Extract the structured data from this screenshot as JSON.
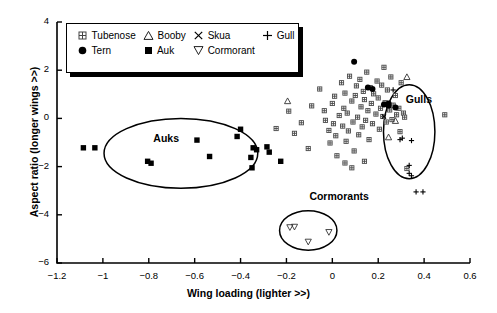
{
  "chart_data": {
    "type": "scatter",
    "title": "",
    "xlabel": "Wing loading (lighter >>)",
    "ylabel": "Aspect ratio (longer wings >>)",
    "xlim": [
      -1.2,
      0.6
    ],
    "ylim": [
      -6,
      4
    ],
    "xticks": [
      "−1.2",
      "−1",
      "−0.8",
      "−0.6",
      "−0.4",
      "−0.2",
      "0",
      "0.2",
      "0.4",
      "0.6"
    ],
    "xtick_values": [
      -1.2,
      -1.0,
      -0.8,
      -0.6,
      -0.4,
      -0.2,
      0,
      0.2,
      0.4,
      0.6
    ],
    "yticks": [
      "4",
      "2",
      "0",
      "−2",
      "−4",
      "−6"
    ],
    "ytick_values": [
      4,
      2,
      0,
      -2,
      -4,
      -6
    ],
    "grid": false,
    "legend_position": "top-left",
    "legend": [
      {
        "label": "Tubenose",
        "marker": "crossed-square"
      },
      {
        "label": "Booby",
        "marker": "open-triangle-up"
      },
      {
        "label": "Skua",
        "marker": "times"
      },
      {
        "label": "Gull",
        "marker": "plus"
      },
      {
        "label": "Tern",
        "marker": "filled-circle"
      },
      {
        "label": "Auk",
        "marker": "filled-square"
      },
      {
        "label": "Cormorant",
        "marker": "open-triangle-down"
      }
    ],
    "annotations": [
      {
        "text": "Auks",
        "x": -0.78,
        "y": -0.85
      },
      {
        "text": "Gulls",
        "x": 0.32,
        "y": 0.75
      },
      {
        "text": "Cormorants",
        "x": -0.1,
        "y": -3.25
      }
    ],
    "ellipses": [
      {
        "label": "Auks",
        "cx": -0.66,
        "cy": -1.45,
        "rx": 0.335,
        "ry": 1.45,
        "rot": 0
      },
      {
        "label": "Gulls",
        "cx": 0.335,
        "cy": -0.55,
        "rx": 0.112,
        "ry": 1.95,
        "rot": 0
      },
      {
        "label": "Cormorants",
        "cx": -0.105,
        "cy": -4.65,
        "rx": 0.125,
        "ry": 0.82,
        "rot": 0
      }
    ],
    "series": [
      {
        "name": "Auk",
        "marker": "filled-square",
        "points": [
          [
            -1.085,
            -1.22
          ],
          [
            -1.035,
            -1.22
          ],
          [
            -0.805,
            -1.78
          ],
          [
            -0.79,
            -1.86
          ],
          [
            -0.59,
            -0.9
          ],
          [
            -0.535,
            -1.58
          ],
          [
            -0.4,
            -0.45
          ],
          [
            -0.415,
            -0.75
          ],
          [
            -0.345,
            -1.22
          ],
          [
            -0.33,
            -1.3
          ],
          [
            -0.355,
            -1.62
          ],
          [
            -0.35,
            -2.05
          ],
          [
            -0.285,
            -1.18
          ],
          [
            -0.275,
            -1.4
          ],
          [
            -0.225,
            -1.78
          ]
        ]
      },
      {
        "name": "Tubenose",
        "marker": "crossed-square",
        "points": [
          [
            -0.245,
            -0.42
          ],
          [
            -0.19,
            0.3
          ],
          [
            -0.165,
            -0.62
          ],
          [
            -0.135,
            -0.18
          ],
          [
            -0.105,
            -1.25
          ],
          [
            -0.09,
            0.52
          ],
          [
            -0.055,
            1.22
          ],
          [
            -0.035,
            0.32
          ],
          [
            -0.03,
            -0.08
          ],
          [
            -0.015,
            -0.5
          ],
          [
            -0.01,
            -1.02
          ],
          [
            0.0,
            0.62
          ],
          [
            0.005,
            -0.22
          ],
          [
            0.01,
            0.92
          ],
          [
            0.015,
            -0.72
          ],
          [
            0.02,
            -1.55
          ],
          [
            0.03,
            0.12
          ],
          [
            0.04,
            1.48
          ],
          [
            0.045,
            -0.32
          ],
          [
            0.05,
            0.42
          ],
          [
            0.055,
            1.05
          ],
          [
            0.06,
            -0.95
          ],
          [
            0.065,
            0.22
          ],
          [
            0.07,
            -0.52
          ],
          [
            0.075,
            1.75
          ],
          [
            0.085,
            0.72
          ],
          [
            0.09,
            -0.15
          ],
          [
            0.095,
            -1.35
          ],
          [
            0.1,
            0.95
          ],
          [
            0.105,
            1.35
          ],
          [
            0.11,
            0.05
          ],
          [
            0.115,
            -0.68
          ],
          [
            0.12,
            1.62
          ],
          [
            0.125,
            0.48
          ],
          [
            0.13,
            -0.35
          ],
          [
            0.135,
            1.12
          ],
          [
            0.14,
            0.78
          ],
          [
            0.145,
            -0.08
          ],
          [
            0.15,
            1.92
          ],
          [
            0.155,
            0.32
          ],
          [
            0.16,
            -0.88
          ],
          [
            0.165,
            1.28
          ],
          [
            0.17,
            0.62
          ],
          [
            0.175,
            -0.22
          ],
          [
            0.18,
            1.02
          ],
          [
            0.19,
            0.18
          ],
          [
            0.195,
            1.55
          ],
          [
            0.2,
            0.85
          ],
          [
            0.205,
            -0.45
          ],
          [
            0.21,
            0.42
          ],
          [
            0.215,
            1.38
          ],
          [
            0.22,
            0.08
          ],
          [
            0.225,
            2.12
          ],
          [
            0.23,
            0.65
          ],
          [
            0.235,
            -0.15
          ],
          [
            0.24,
            1.18
          ],
          [
            0.25,
            0.35
          ],
          [
            0.255,
            1.72
          ],
          [
            0.26,
            -0.05
          ],
          [
            0.265,
            0.55
          ],
          [
            0.275,
            0.95
          ],
          [
            0.28,
            0.15
          ],
          [
            0.29,
            0.42
          ],
          [
            0.3,
            1.48
          ],
          [
            0.31,
            0.22
          ],
          [
            0.055,
            -1.85
          ],
          [
            0.14,
            -1.78
          ],
          [
            0.085,
            -2.05
          ],
          [
            0.295,
            -0.55
          ],
          [
            0.315,
            0.05
          ],
          [
            0.49,
            0.15
          ],
          [
            0.325,
            -2.08
          ]
        ]
      },
      {
        "name": "Tern",
        "marker": "filled-circle",
        "points": [
          [
            0.095,
            2.35
          ],
          [
            0.155,
            1.28
          ],
          [
            0.175,
            1.22
          ],
          [
            0.225,
            0.58
          ],
          [
            0.245,
            0.52
          ],
          [
            0.275,
            0.45
          ],
          [
            0.245,
            0.62
          ]
        ]
      },
      {
        "name": "Booby",
        "marker": "open-triangle-up",
        "points": [
          [
            -0.195,
            0.72
          ],
          [
            0.275,
            -0.1
          ],
          [
            0.245,
            -0.78
          ],
          [
            0.325,
            1.72
          ]
        ]
      },
      {
        "name": "Skua",
        "marker": "times",
        "points": [
          [
            0.225,
            0.08
          ]
        ]
      },
      {
        "name": "Gull",
        "marker": "plus",
        "points": [
          [
            0.265,
            1.18
          ],
          [
            0.295,
            -0.88
          ],
          [
            0.305,
            -0.82
          ],
          [
            0.345,
            -0.92
          ],
          [
            0.335,
            -1.95
          ],
          [
            0.335,
            -2.28
          ],
          [
            0.345,
            -2.38
          ],
          [
            0.365,
            -3.05
          ],
          [
            0.395,
            -3.05
          ]
        ]
      },
      {
        "name": "Cormorant",
        "marker": "open-triangle-down",
        "points": [
          [
            -0.185,
            -4.52
          ],
          [
            -0.165,
            -4.5
          ],
          [
            -0.105,
            -5.12
          ],
          [
            -0.015,
            -4.72
          ]
        ]
      }
    ]
  }
}
